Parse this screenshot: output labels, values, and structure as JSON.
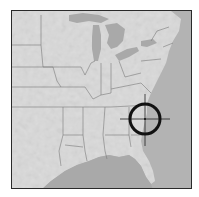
{
  "map": {
    "region": "Eastern United States",
    "style": "grayscale shaded relief",
    "colors": {
      "land": "#dcdcdc",
      "land_alt": "#cfcfcf",
      "water": "#a9a9a9",
      "state_borders": "#6e6e6e",
      "frame": "#2a2a2a",
      "crosshair": "#111111"
    },
    "marker": {
      "type": "crosshair-target",
      "center_px": [
        144,
        118
      ],
      "radius_px": 15
    }
  }
}
